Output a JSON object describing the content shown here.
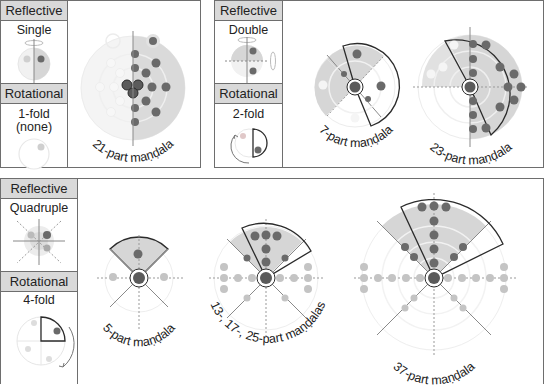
{
  "panels": [
    {
      "reflective_header": "Reflective",
      "reflective_type": "Single",
      "rotational_header": "Rotational",
      "rotational_type_line1": "1-fold",
      "rotational_type_line2": "(none)",
      "mandalas": [
        {
          "label": "21-part maṇḍala"
        }
      ]
    },
    {
      "reflective_header": "Reflective",
      "reflective_type": "Double",
      "rotational_header": "Rotational",
      "rotational_type_line1": "2-fold",
      "mandalas": [
        {
          "label": "7-part maṇḍala"
        },
        {
          "label": "23-part maṇḍala"
        }
      ]
    },
    {
      "reflective_header": "Reflective",
      "reflective_type": "Quadruple",
      "rotational_header": "Rotational",
      "rotational_type_line1": "4-fold",
      "mandalas": [
        {
          "label": "5-part maṇḍala"
        },
        {
          "label": "13-, 17-, 25-part maṇḍalas"
        },
        {
          "label": "37-part maṇḍala"
        }
      ]
    }
  ],
  "colors": {
    "dark_dot": "#6a6a6a",
    "light_dot": "#c4c4c4",
    "shade": "#d6d6d6",
    "faint": "#ececec",
    "outline": "#2b2b2b"
  }
}
